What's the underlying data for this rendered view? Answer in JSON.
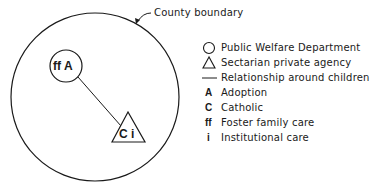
{
  "boundary": {
    "label": "County boundary"
  },
  "nodes": [
    {
      "shape": "circle",
      "label": "ff A"
    },
    {
      "shape": "triangle",
      "label": "C i"
    }
  ],
  "legend": {
    "symbols": [
      {
        "icon": "circle-icon",
        "label": "Public Welfare Department"
      },
      {
        "icon": "triangle-icon",
        "label": "Sectarian private agency"
      },
      {
        "icon": "line-icon",
        "label": "Relationship around children"
      }
    ],
    "codes": [
      {
        "code": "A",
        "label": "Adoption"
      },
      {
        "code": "C",
        "label": "Catholic"
      },
      {
        "code": "ff",
        "label": "Foster family care"
      },
      {
        "code": "i",
        "label": "Institutional care"
      }
    ]
  },
  "colors": {
    "ink": "#1a1a1a",
    "background": "#ffffff"
  }
}
